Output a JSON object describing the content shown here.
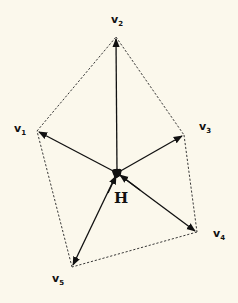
{
  "diagram": {
    "type": "star-polygon",
    "background": "#fbf8ec",
    "line_color": "#111111",
    "hub": {
      "label": "H",
      "x": 117,
      "y": 173
    },
    "vertices": [
      {
        "id": "v1",
        "name": "v",
        "sub": "1",
        "x": 37,
        "y": 131
      },
      {
        "id": "v2",
        "name": "v",
        "sub": "2",
        "x": 116,
        "y": 37
      },
      {
        "id": "v3",
        "name": "v",
        "sub": "3",
        "x": 184,
        "y": 135
      },
      {
        "id": "v4",
        "name": "v",
        "sub": "4",
        "x": 197,
        "y": 232
      },
      {
        "id": "v5",
        "name": "v",
        "sub": "5",
        "x": 72,
        "y": 267
      }
    ],
    "solid_edges": "hub to each vertex (arrows pointing outward to v1..v5)",
    "dashed_edges": "polygon boundary v1-v2-v3-v4-v5-v1"
  }
}
